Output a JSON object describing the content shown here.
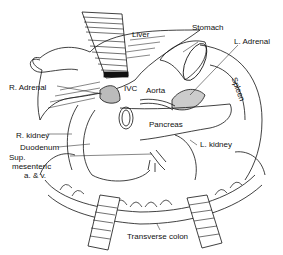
{
  "figure": {
    "type": "anatomical illustration",
    "labels": {
      "liver": "Liver",
      "stomach": "Stomach",
      "l_adrenal": "L. Adrenal",
      "spleen": "Spleen",
      "r_adrenal": "R. Adrenal",
      "ivc": "IVC",
      "aorta": "Aorta",
      "pancreas": "Pancreas",
      "r_kidney": "R. kidney",
      "duodenum": "Duodenum",
      "l_kidney": "L. kidney",
      "sup_mesenteric_1": "Sup.",
      "sup_mesenteric_2": "mesenteric",
      "sup_mesenteric_3": "a. & v.",
      "transverse_colon": "Transverse colon"
    }
  }
}
